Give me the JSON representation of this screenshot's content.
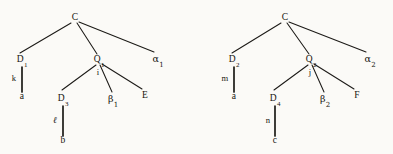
{
  "figure": {
    "type": "two-parallel-derivation-trees",
    "background_color": "#fbfaf7",
    "ink_color": "#17150f"
  },
  "trees": [
    {
      "id": "left-tree",
      "root": {
        "label": "C",
        "x": 75,
        "y": 18
      },
      "nodes": [
        {
          "name": "root-c",
          "label": "C",
          "sub": "",
          "x": 75,
          "y": 18
        },
        {
          "name": "d1",
          "label": "D",
          "sub": "1",
          "x": 22,
          "y": 60
        },
        {
          "name": "a-left",
          "label": "a",
          "sub": "",
          "x": 22,
          "y": 97
        },
        {
          "name": "q1",
          "label": "Q",
          "sub": "1",
          "x": 99,
          "y": 60
        },
        {
          "name": "d3",
          "label": "D",
          "sub": "3",
          "x": 63,
          "y": 99
        },
        {
          "name": "b-left",
          "label": "b",
          "sub": "",
          "x": 63,
          "y": 141
        },
        {
          "name": "beta1",
          "label": "β",
          "sub": "1",
          "x": 113,
          "y": 99
        },
        {
          "name": "e-left",
          "label": "E",
          "sub": "",
          "x": 145,
          "y": 96
        },
        {
          "name": "alpha1",
          "label": "α",
          "sub": "1",
          "x": 158,
          "y": 59
        }
      ],
      "edge_labels": [
        {
          "name": "edge-label-k",
          "label": "k",
          "x": 14,
          "y": 78
        },
        {
          "name": "edge-label-i",
          "label": "i",
          "x": 98,
          "y": 72
        },
        {
          "name": "edge-label-l",
          "label": "ℓ",
          "x": 55,
          "y": 120
        }
      ],
      "edges": [
        {
          "from": "root-c",
          "to": "d1",
          "x1": 71,
          "y1": 23,
          "x2": 20,
          "y2": 53,
          "thick": false
        },
        {
          "from": "root-c",
          "to": "q1",
          "x1": 77,
          "y1": 23,
          "x2": 97,
          "y2": 54,
          "thick": false
        },
        {
          "from": "root-c",
          "to": "alpha1",
          "x1": 79,
          "y1": 22,
          "x2": 154,
          "y2": 52,
          "thick": false
        },
        {
          "from": "d1",
          "to": "a-left",
          "x1": 22,
          "y1": 67,
          "x2": 22,
          "y2": 92,
          "thick": true
        },
        {
          "from": "q1",
          "to": "d3",
          "x1": 96,
          "y1": 65,
          "x2": 62,
          "y2": 90,
          "thick": false
        },
        {
          "from": "q1",
          "to": "beta1",
          "x1": 100,
          "y1": 65,
          "x2": 112,
          "y2": 92,
          "thick": false
        },
        {
          "from": "q1",
          "to": "e-left",
          "x1": 102,
          "y1": 64,
          "x2": 142,
          "y2": 89,
          "thick": false
        },
        {
          "from": "d3",
          "to": "b-left",
          "x1": 63,
          "y1": 106,
          "x2": 63,
          "y2": 136,
          "thick": true
        }
      ]
    },
    {
      "id": "right-tree",
      "root": {
        "label": "C",
        "x": 285,
        "y": 18
      },
      "nodes": [
        {
          "name": "root-c",
          "label": "C",
          "sub": "",
          "x": 285,
          "y": 18
        },
        {
          "name": "d2",
          "label": "D",
          "sub": "2",
          "x": 234,
          "y": 60
        },
        {
          "name": "a-right",
          "label": "a",
          "sub": "",
          "x": 234,
          "y": 97
        },
        {
          "name": "q2",
          "label": "Q",
          "sub": "2",
          "x": 311,
          "y": 60
        },
        {
          "name": "d4",
          "label": "D",
          "sub": "4",
          "x": 275,
          "y": 99
        },
        {
          "name": "c-right",
          "label": "c",
          "sub": "",
          "x": 275,
          "y": 141
        },
        {
          "name": "beta2",
          "label": "β",
          "sub": "2",
          "x": 325,
          "y": 99
        },
        {
          "name": "f-right",
          "label": "F",
          "sub": "",
          "x": 357,
          "y": 96
        },
        {
          "name": "alpha2",
          "label": "α",
          "sub": "2",
          "x": 370,
          "y": 59
        }
      ],
      "edge_labels": [
        {
          "name": "edge-label-m",
          "label": "m",
          "x": 225,
          "y": 78
        },
        {
          "name": "edge-label-j",
          "label": "j",
          "x": 310,
          "y": 72
        },
        {
          "name": "edge-label-n",
          "label": "n",
          "x": 268,
          "y": 120
        }
      ],
      "edges": [
        {
          "from": "root-c",
          "to": "d2",
          "x1": 281,
          "y1": 23,
          "x2": 232,
          "y2": 53,
          "thick": false
        },
        {
          "from": "root-c",
          "to": "q2",
          "x1": 287,
          "y1": 23,
          "x2": 309,
          "y2": 54,
          "thick": false
        },
        {
          "from": "root-c",
          "to": "alpha2",
          "x1": 289,
          "y1": 22,
          "x2": 366,
          "y2": 52,
          "thick": false
        },
        {
          "from": "d2",
          "to": "a-right",
          "x1": 234,
          "y1": 67,
          "x2": 234,
          "y2": 92,
          "thick": true
        },
        {
          "from": "q2",
          "to": "d4",
          "x1": 308,
          "y1": 65,
          "x2": 274,
          "y2": 90,
          "thick": false
        },
        {
          "from": "q2",
          "to": "beta2",
          "x1": 312,
          "y1": 65,
          "x2": 324,
          "y2": 92,
          "thick": false
        },
        {
          "from": "q2",
          "to": "f-right",
          "x1": 314,
          "y1": 64,
          "x2": 354,
          "y2": 89,
          "thick": false
        },
        {
          "from": "d4",
          "to": "c-right",
          "x1": 275,
          "y1": 106,
          "x2": 275,
          "y2": 136,
          "thick": true
        }
      ]
    }
  ]
}
